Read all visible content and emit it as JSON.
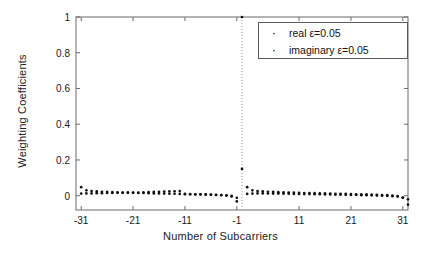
{
  "chart_data": {
    "type": "scatter",
    "title": "",
    "xlabel": "Number of Subcarriers",
    "ylabel": "Weighting Coefficients",
    "xlim": [
      -32,
      32
    ],
    "ylim": [
      -0.08,
      1.0
    ],
    "xticks": [
      -31,
      -21,
      -11,
      -1,
      11,
      21,
      31
    ],
    "xticklabels": [
      "-31",
      "-21",
      "-11",
      "-1",
      "11",
      "21",
      "31"
    ],
    "yticks": [
      0,
      0.2,
      0.4,
      0.6,
      0.8,
      1
    ],
    "yticklabels": [
      "0",
      "0.2",
      "0.4",
      "0.6",
      "0.8",
      "1"
    ],
    "grid": false,
    "center_reference_line_x": 0,
    "legend": {
      "position": "upper-right",
      "entries": [
        {
          "label": "real ε=0.05",
          "marker": "dot",
          "color": "#111111"
        },
        {
          "label": "imaginary ε=0.05",
          "marker": "dot",
          "color": "#111111"
        }
      ]
    },
    "series": [
      {
        "name": "real ε=0.05",
        "marker": "dot",
        "color": "#111111",
        "x": [
          -31,
          -30,
          -29,
          -28,
          -27,
          -26,
          -25,
          -24,
          -23,
          -22,
          -21,
          -20,
          -19,
          -18,
          -17,
          -16,
          -15,
          -14,
          -13,
          -12,
          -11,
          -10,
          -9,
          -8,
          -7,
          -6,
          -5,
          -4,
          -3,
          -2,
          -1,
          0,
          1,
          2,
          3,
          4,
          5,
          6,
          7,
          8,
          9,
          10,
          11,
          12,
          13,
          14,
          15,
          16,
          17,
          18,
          19,
          20,
          21,
          22,
          23,
          24,
          25,
          26,
          27,
          28,
          29,
          30,
          31,
          32
        ],
        "y": [
          0.012,
          0.013,
          0.013,
          0.014,
          0.014,
          0.015,
          0.015,
          0.016,
          0.016,
          0.017,
          0.018,
          0.018,
          0.019,
          0.02,
          0.021,
          0.022,
          0.023,
          0.024,
          0.025,
          0.026,
          0.008,
          0.008,
          0.007,
          0.007,
          0.006,
          0.005,
          0.004,
          0.003,
          0.001,
          -0.004,
          -0.012,
          1.0,
          0.01,
          0.012,
          0.013,
          0.013,
          0.013,
          0.012,
          0.012,
          0.011,
          0.011,
          0.01,
          0.01,
          0.009,
          0.009,
          0.008,
          0.008,
          0.007,
          0.007,
          0.006,
          0.006,
          0.005,
          0.004,
          0.004,
          0.003,
          0.003,
          0.002,
          0.001,
          0.0,
          -0.001,
          -0.003,
          -0.005,
          -0.01,
          -0.02
        ]
      },
      {
        "name": "imaginary ε=0.05",
        "marker": "dot",
        "color": "#111111",
        "x": [
          -31,
          -30,
          -29,
          -28,
          -27,
          -26,
          -25,
          -24,
          -23,
          -22,
          -21,
          -20,
          -19,
          -18,
          -17,
          -16,
          -15,
          -14,
          -13,
          -12,
          -11,
          -10,
          -9,
          -8,
          -7,
          -6,
          -5,
          -4,
          -3,
          -2,
          -1,
          0,
          1,
          2,
          3,
          4,
          5,
          6,
          7,
          8,
          9,
          10,
          11,
          12,
          13,
          14,
          15,
          16,
          17,
          18,
          19,
          20,
          21,
          22,
          23,
          24,
          25,
          26,
          27,
          28,
          29,
          30,
          31,
          32
        ],
        "y": [
          0.048,
          0.03,
          0.026,
          0.024,
          0.022,
          0.021,
          0.02,
          0.019,
          0.018,
          0.017,
          0.016,
          0.015,
          0.015,
          0.014,
          0.013,
          0.013,
          0.012,
          0.011,
          0.011,
          0.01,
          0.01,
          0.009,
          0.008,
          0.008,
          0.007,
          0.006,
          0.005,
          0.004,
          0.002,
          -0.001,
          -0.032,
          0.15,
          0.048,
          0.03,
          0.026,
          0.024,
          0.022,
          0.021,
          0.02,
          0.019,
          0.018,
          0.017,
          0.016,
          0.015,
          0.015,
          0.014,
          0.013,
          0.013,
          0.012,
          0.011,
          0.011,
          0.01,
          0.009,
          0.008,
          0.008,
          0.007,
          0.006,
          0.005,
          0.004,
          0.003,
          0.001,
          -0.002,
          -0.012,
          -0.05
        ]
      }
    ]
  },
  "axes": {
    "x_label": "Number of Subcarriers",
    "y_label": "Weighting Coefficients"
  }
}
